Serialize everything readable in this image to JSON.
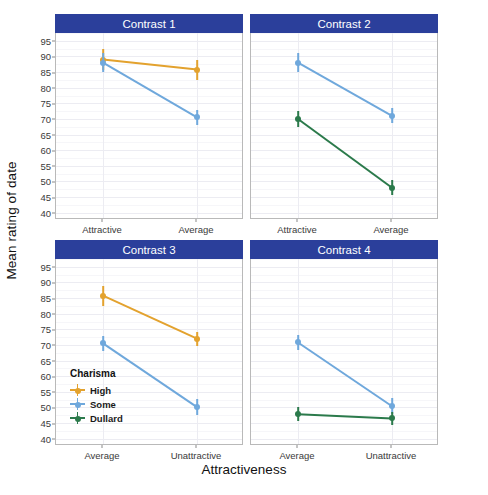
{
  "chart_data": {
    "type": "line",
    "title": "",
    "xlabel": "Attractiveness",
    "ylabel": "Mean rating of date",
    "ylim": [
      38,
      97.5
    ],
    "yticks": [
      95,
      90,
      85,
      80,
      75,
      70,
      65,
      60,
      55,
      50,
      45,
      40
    ],
    "grid": true,
    "legend": {
      "title": "Charisma",
      "position": "inside-panel-3-lower-left",
      "entries": [
        {
          "label": "High",
          "color": "#e3a22e"
        },
        {
          "label": "Some",
          "color": "#6fa8dc"
        },
        {
          "label": "Dullard",
          "color": "#2b7a4b"
        }
      ]
    },
    "facets": [
      {
        "strip": "Contrast 1",
        "categories": [
          "Attractive",
          "Average"
        ],
        "series": [
          {
            "name": "High",
            "color": "#e3a22e",
            "values": [
              89.0,
              85.8
            ],
            "errors": [
              3.3,
              3.2
            ]
          },
          {
            "name": "Some",
            "color": "#6fa8dc",
            "values": [
              88.0,
              70.5
            ],
            "errors": [
              3.0,
              2.4
            ]
          }
        ]
      },
      {
        "strip": "Contrast 2",
        "categories": [
          "Attractive",
          "Average"
        ],
        "series": [
          {
            "name": "Some",
            "color": "#6fa8dc",
            "values": [
              88.0,
              71.0
            ],
            "errors": [
              3.0,
              2.4
            ]
          },
          {
            "name": "Dullard",
            "color": "#2b7a4b",
            "values": [
              70.0,
              48.0
            ],
            "errors": [
              2.6,
              2.4
            ]
          }
        ]
      },
      {
        "strip": "Contrast 3",
        "categories": [
          "Average",
          "Unattractive"
        ],
        "series": [
          {
            "name": "High",
            "color": "#e3a22e",
            "values": [
              85.8,
              72.0
            ],
            "errors": [
              3.2,
              2.3
            ]
          },
          {
            "name": "Some",
            "color": "#6fa8dc",
            "values": [
              70.5,
              50.1
            ],
            "errors": [
              2.4,
              2.6
            ]
          }
        ]
      },
      {
        "strip": "Contrast 4",
        "categories": [
          "Average",
          "Unattractive"
        ],
        "series": [
          {
            "name": "Some",
            "color": "#6fa8dc",
            "values": [
              70.8,
              50.4
            ],
            "errors": [
              2.4,
              2.6
            ]
          },
          {
            "name": "Dullard",
            "color": "#2b7a4b",
            "values": [
              47.8,
              46.5
            ],
            "errors": [
              2.2,
              2.2
            ]
          }
        ]
      }
    ]
  },
  "strip_background": "#2b3f9b",
  "strip_text_color": "#ffffff"
}
